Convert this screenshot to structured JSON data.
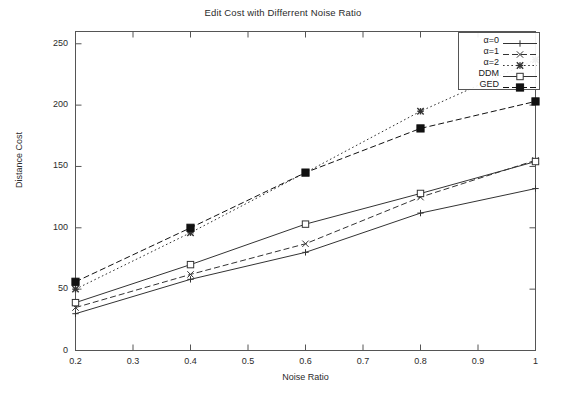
{
  "chart_data": {
    "type": "line",
    "title": "Edit Cost with Differrent Noise Ratio",
    "xlabel": "Noise Ratio",
    "ylabel": "Distance Cost",
    "x": [
      0.2,
      0.4,
      0.6,
      0.8,
      1.0
    ],
    "xlim": [
      0.2,
      1.0
    ],
    "ylim": [
      0,
      260
    ],
    "xticks": [
      0.2,
      0.3,
      0.4,
      0.5,
      0.6,
      0.7,
      0.8,
      0.9,
      1.0
    ],
    "xticklabels": [
      "0.2",
      "0.3",
      "0.4",
      "0.5",
      "0.6",
      "0.7",
      "0.8",
      "0.9",
      "1"
    ],
    "yticks": [
      0,
      50,
      100,
      150,
      200,
      250
    ],
    "yticklabels": [
      "0",
      "50",
      "100",
      "150",
      "200",
      "250"
    ],
    "grid": false,
    "legend_position": "upper right",
    "series": [
      {
        "name": "α=0",
        "values": [
          30,
          58,
          80,
          112,
          132
        ],
        "marker": "plus",
        "linestyle": "solid",
        "color": "#333333"
      },
      {
        "name": "α=1",
        "values": [
          35,
          62,
          87,
          125,
          155
        ],
        "marker": "cross",
        "linestyle": "dashed",
        "color": "#333333"
      },
      {
        "name": "α=2",
        "values": [
          50,
          96,
          145,
          195,
          237
        ],
        "marker": "star",
        "linestyle": "dotted",
        "color": "#333333"
      },
      {
        "name": "DDM",
        "values": [
          39,
          70,
          103,
          128,
          154
        ],
        "marker": "open-square",
        "linestyle": "solid",
        "color": "#333333"
      },
      {
        "name": "GED",
        "values": [
          56,
          100,
          145,
          181,
          203
        ],
        "marker": "filled-square",
        "linestyle": "dashed",
        "color": "#111111"
      }
    ]
  },
  "legend": {
    "entries": [
      {
        "label": "α=0"
      },
      {
        "label": "α=1"
      },
      {
        "label": "α=2"
      },
      {
        "label": "DDM"
      },
      {
        "label": "GED"
      }
    ]
  }
}
